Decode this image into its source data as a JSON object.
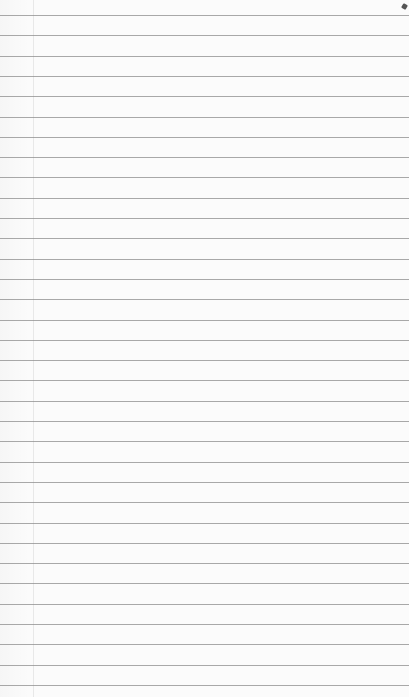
{
  "paper": {
    "type": "lined-paper",
    "background_color": "#fbfbfb",
    "rule_color": "#8c8c8c",
    "rule_start_y": 15,
    "rule_spacing": 20.3,
    "rule_count": 34,
    "margin_line_x": 33
  }
}
